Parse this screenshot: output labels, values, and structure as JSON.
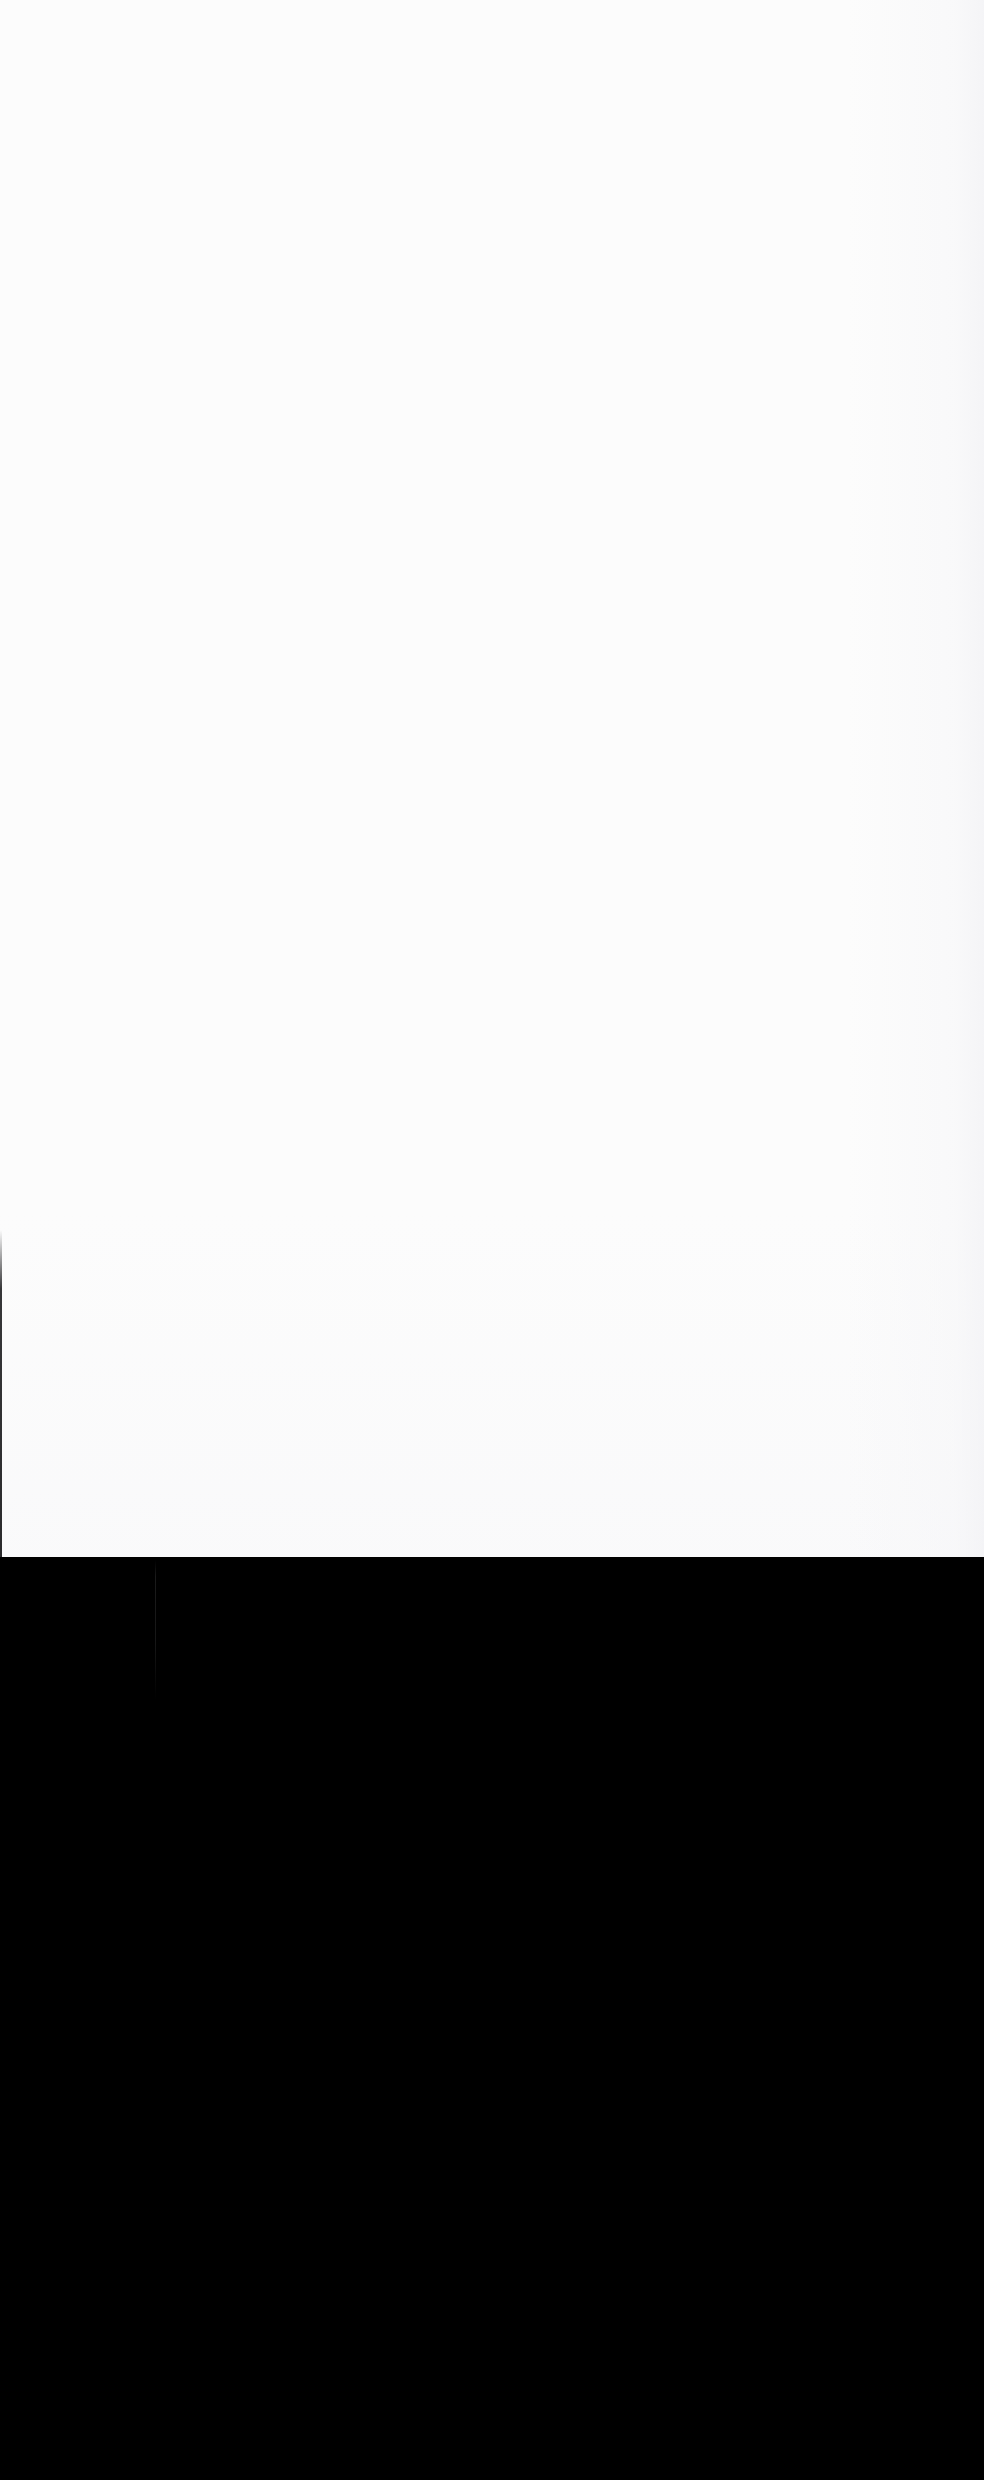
{
  "capture": {
    "width": 984,
    "height": 2480,
    "content_present": false,
    "description": "Blank screen capture containing no user-interface content. No text, icons, controls, or imagery are rendered anywhere in the frame."
  },
  "regions": [
    {
      "name": "upper-blank-panel",
      "role": "empty-viewport",
      "x": 0,
      "y": 0,
      "width": 984,
      "height": 1557,
      "color": "#fcfcfc",
      "notes": "Uniform near-white field. Only faint JPEG compression noise is present; no glyphs or widgets."
    },
    {
      "name": "lower-blank-panel",
      "role": "empty-letterbox",
      "x": 0,
      "y": 1557,
      "width": 984,
      "height": 923,
      "color": "#000000",
      "notes": "Uniform pure-black field with no content."
    }
  ],
  "artifacts": [
    {
      "name": "left-edge-hairline",
      "x": 0,
      "y": 1230,
      "width": 2,
      "height": 327,
      "color": "#141416",
      "notes": "Thin dark vertical line hugging the extreme left border of the white panel."
    },
    {
      "name": "black-panel-seam",
      "x": 155,
      "y": 1560,
      "width": 1,
      "height": 140,
      "color": "#1a1a1a",
      "notes": "Very low-contrast vertical seam fading out partway down the black panel."
    }
  ],
  "colors": {
    "upper_background": "#fcfcfc",
    "lower_background": "#000000",
    "left_edge_hairline": "#141416",
    "seam": "#1a1a1a"
  },
  "boundaries": {
    "panel_split_y": 1557,
    "left_hairline_start_y": 1230,
    "seam_x": 155
  }
}
